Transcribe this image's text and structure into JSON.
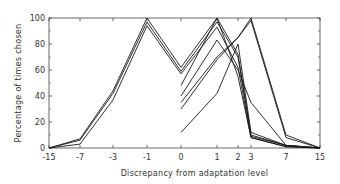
{
  "chart_data": {
    "type": "line",
    "title": "",
    "xlabel": "Discrepancy from adaptation level",
    "ylabel": "Percentage of times chosen",
    "x": [
      -15,
      -7,
      -3,
      -1,
      0,
      1,
      2,
      3,
      7,
      15
    ],
    "x_tick_labels": [
      "-15",
      "-7",
      "-3",
      "-1",
      "0",
      "1",
      "2",
      "3",
      "7",
      "15"
    ],
    "y_ticks": [
      0,
      20,
      40,
      60,
      80,
      100
    ],
    "ylim": [
      0,
      100
    ],
    "grid": false,
    "legend": null,
    "series": [
      {
        "name": "curve-1",
        "values": [
          0,
          7,
          44,
          100,
          62,
          100,
          72,
          10,
          2,
          0
        ]
      },
      {
        "name": "curve-2",
        "values": [
          0,
          6,
          42,
          97,
          59,
          97,
          70,
          9,
          2,
          0
        ]
      },
      {
        "name": "curve-3",
        "values": [
          0,
          3,
          37,
          94,
          57,
          93,
          62,
          8,
          1,
          0
        ]
      },
      {
        "name": "curve-4",
        "values": [
          null,
          null,
          null,
          null,
          48,
          100,
          55,
          8,
          1,
          0
        ]
      },
      {
        "name": "curve-5",
        "values": [
          null,
          null,
          null,
          null,
          40,
          83,
          60,
          35,
          2,
          0
        ]
      },
      {
        "name": "curve-6",
        "values": [
          null,
          null,
          null,
          null,
          35,
          70,
          85,
          100,
          10,
          0
        ]
      },
      {
        "name": "curve-7",
        "values": [
          null,
          null,
          null,
          null,
          30,
          68,
          85,
          98,
          8,
          0
        ]
      },
      {
        "name": "curve-8",
        "values": [
          null,
          null,
          null,
          null,
          12,
          42,
          80,
          12,
          2,
          0
        ]
      }
    ]
  },
  "axes": {
    "y_labels": [
      "0",
      "20",
      "40",
      "60",
      "80",
      "100"
    ],
    "x_labels": [
      "-15",
      "-7",
      "-3",
      "-1",
      "0",
      "1",
      "2",
      "3",
      "7",
      "15"
    ],
    "x_title": "Discrepancy from adaptation level",
    "y_title": "Percentage of times chosen"
  }
}
